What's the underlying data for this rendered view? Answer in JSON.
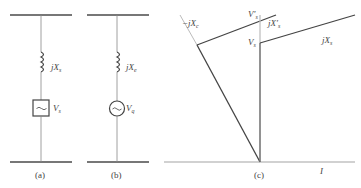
{
  "diagram": {
    "panels": [
      {
        "id": "a",
        "caption": "(a)",
        "reactance": {
          "prefix": "jX",
          "sub": "s"
        },
        "source": {
          "symbol": "~",
          "shape": "square",
          "prefix": "V",
          "sub": "s"
        }
      },
      {
        "id": "b",
        "caption": "(b)",
        "reactance": {
          "prefix": "jX",
          "sub": "e"
        },
        "source": {
          "symbol": "~",
          "shape": "circle",
          "prefix": "V",
          "sub": "q"
        }
      },
      {
        "id": "c",
        "caption": "(c)",
        "labels": {
          "neg_jxc": {
            "prefix": "−jX",
            "sub": "c"
          },
          "vs_prime": {
            "prefix": "V′",
            "sub": "s"
          },
          "jxs_prime": {
            "prefix": "jX′",
            "sub": "s"
          },
          "vs": {
            "prefix": "V",
            "sub": "s"
          },
          "jxs": {
            "prefix": "jX",
            "sub": "s"
          },
          "current": "I"
        }
      }
    ],
    "colors": {
      "line": "#555555",
      "bus": "#777777",
      "light_line": "#aaaaaa"
    }
  }
}
